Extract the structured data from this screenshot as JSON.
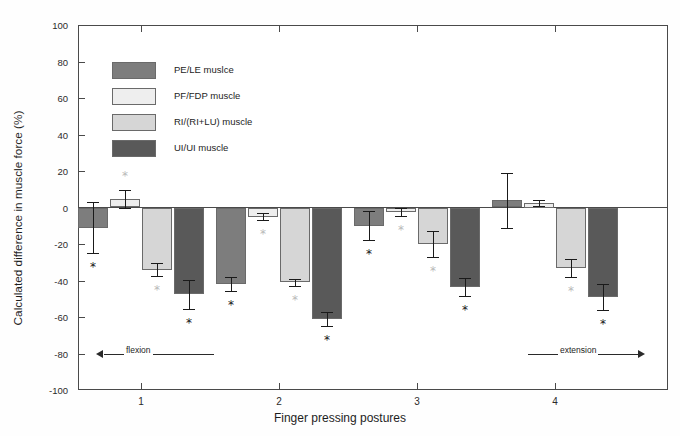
{
  "chart_data": {
    "type": "bar",
    "title": "",
    "xlabel": "Finger pressing postures",
    "ylabel": "Calculated difference in muscle force (%)",
    "categories": [
      "1",
      "2",
      "3",
      "4"
    ],
    "ylim": [
      -100,
      100
    ],
    "yticks": [
      100,
      80,
      60,
      40,
      20,
      0,
      -20,
      -40,
      -60,
      -80,
      -100
    ],
    "grid": false,
    "legend_position": "upper-left-inside",
    "series": [
      {
        "name": "PE/LE muslce",
        "color": "#7d7d7d",
        "values": [
          -11.0,
          -42.0,
          -10.0,
          4.0
        ],
        "errors": [
          14.0,
          4.0,
          8.0,
          15.0
        ],
        "significance": [
          "*",
          "*",
          "*",
          ""
        ]
      },
      {
        "name": "PF/FDP muscle",
        "color": "#eeeeee",
        "values": [
          4.5,
          -5.0,
          -2.5,
          2.5
        ],
        "errors": [
          5.0,
          2.0,
          2.0,
          1.5
        ],
        "significance": [
          "*",
          "*",
          "*",
          ""
        ]
      },
      {
        "name": "RI/(RI+LU) muscle",
        "color": "#d6d6d6",
        "values": [
          -34.0,
          -41.0,
          -20.0,
          -33.0
        ],
        "errors": [
          3.5,
          2.0,
          7.0,
          5.0
        ],
        "significance": [
          "*",
          "*",
          "*",
          "*"
        ]
      },
      {
        "name": "UI/UI muscle",
        "color": "#595959",
        "values": [
          -47.5,
          -61.0,
          -43.5,
          -49.0
        ],
        "errors": [
          8.0,
          4.0,
          5.0,
          7.0
        ],
        "significance": [
          "*",
          "*",
          "*",
          "*"
        ]
      }
    ],
    "annotations": [
      {
        "text": "flexion",
        "direction": "left"
      },
      {
        "text": "extension",
        "direction": "right"
      }
    ]
  },
  "axes": {
    "y_title": "Calculated difference in muscle force (%)",
    "x_title": "Finger pressing postures",
    "y_tick_labels": [
      "100",
      "80",
      "60",
      "40",
      "20",
      "0",
      "-20",
      "-40",
      "-60",
      "-80",
      "-100"
    ],
    "x_tick_labels": [
      "1",
      "2",
      "3",
      "4"
    ]
  },
  "legend": {
    "items": [
      {
        "label": "PE/LE muslce",
        "color": "#7d7d7d"
      },
      {
        "label": "PF/FDP muscle",
        "color": "#eeeeee"
      },
      {
        "label": "RI/(RI+LU) muscle",
        "color": "#d6d6d6"
      },
      {
        "label": "UI/UI muscle",
        "color": "#595959"
      }
    ]
  },
  "annotations": {
    "flexion_label": "flexion",
    "extension_label": "extension",
    "significance_marker": "*"
  },
  "colors": {
    "axis": "#4a4a4a",
    "text": "#1d1d1d",
    "error_bar": "#1a1a1a",
    "background": "#ffffff"
  }
}
